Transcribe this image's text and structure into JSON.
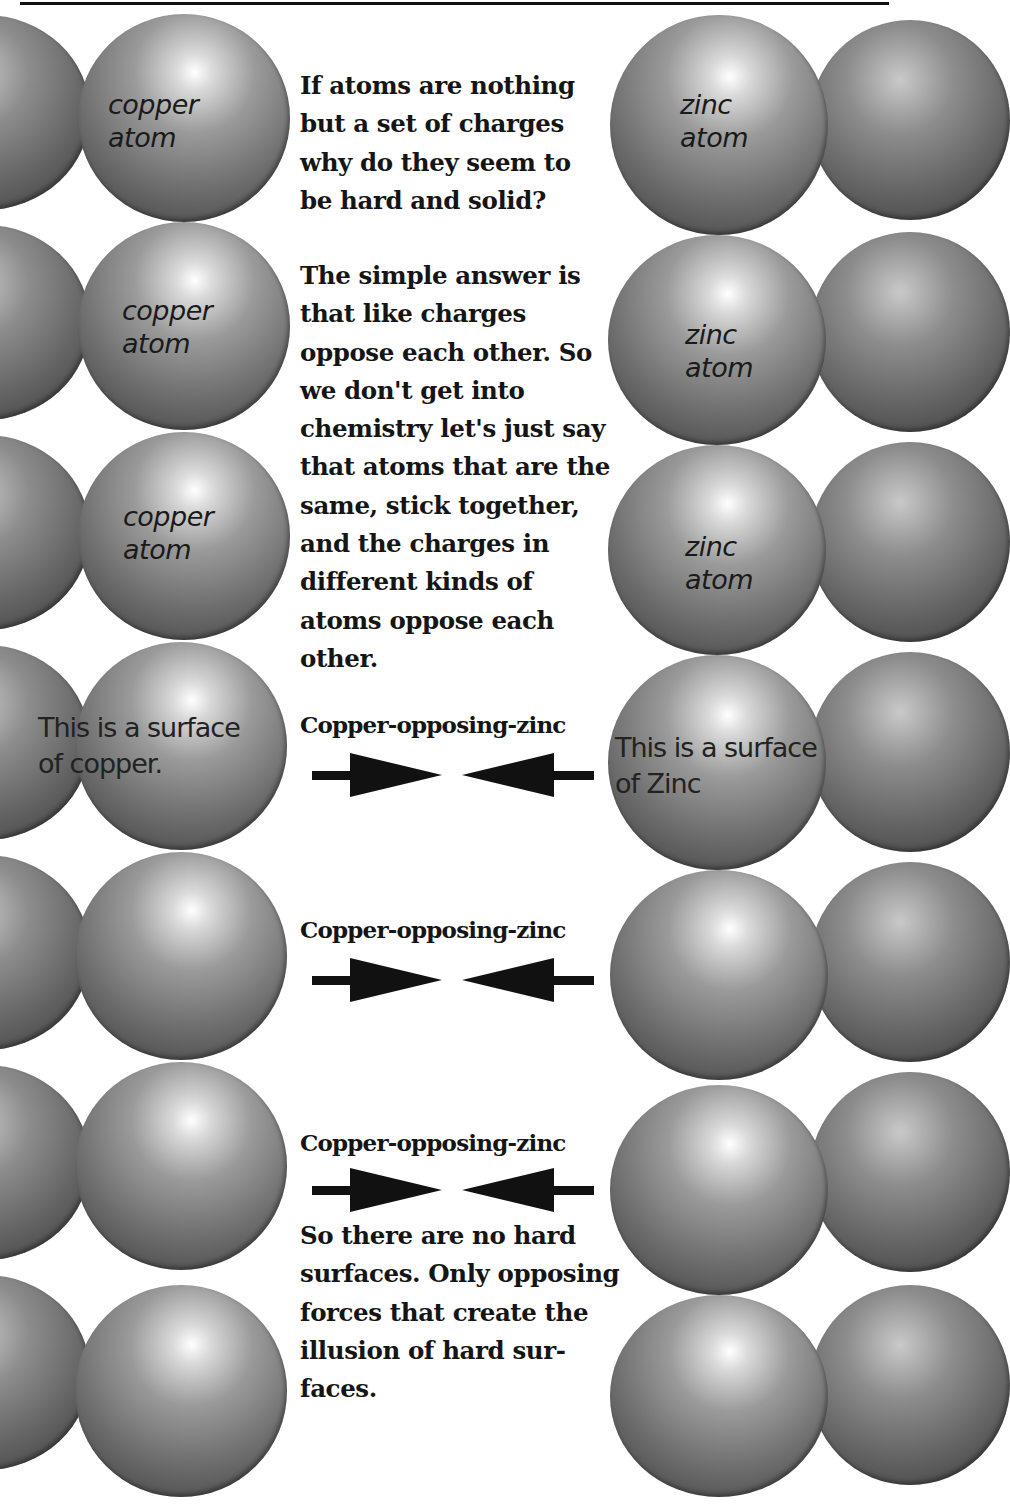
{
  "figure": {
    "copper_side": {
      "atom_labels": [
        {
          "line1": "copper",
          "line2": "atom"
        },
        {
          "line1": "copper",
          "line2": "atom"
        },
        {
          "line1": "copper",
          "line2": "atom"
        }
      ],
      "surface_label": {
        "line1": "This is a surface",
        "line2": "of copper."
      }
    },
    "zinc_side": {
      "atom_labels": [
        {
          "line1": "zinc",
          "line2": "atom"
        },
        {
          "line1": "zinc",
          "line2": "atom"
        },
        {
          "line1": "zinc",
          "line2": "atom"
        }
      ],
      "surface_label": {
        "line1": "This is a surface",
        "line2": "of Zinc"
      }
    },
    "text": {
      "question": "If atoms are nothing but a set of charges why do they seem to be hard and solid?",
      "answer": "The simple answer is that like charges oppose each other. So we don't get into chemistry let's just say that atoms that are the same, stick together, and the charges in different kinds of atoms oppose each other.",
      "conclusion": "So there are no hard surfaces. Only opposing forces that create the illusion of hard sur-faces."
    },
    "forces": [
      {
        "label": "Copper-opposing-zinc",
        "icon": "opposing-arrows-icon"
      },
      {
        "label": "Copper-opposing-zinc",
        "icon": "opposing-arrows-icon"
      },
      {
        "label": "Copper-opposing-zinc",
        "icon": "opposing-arrows-icon"
      }
    ],
    "colors": {
      "sphere": "#7a7a7a",
      "text": "#151515",
      "background": "#ffffff"
    }
  }
}
